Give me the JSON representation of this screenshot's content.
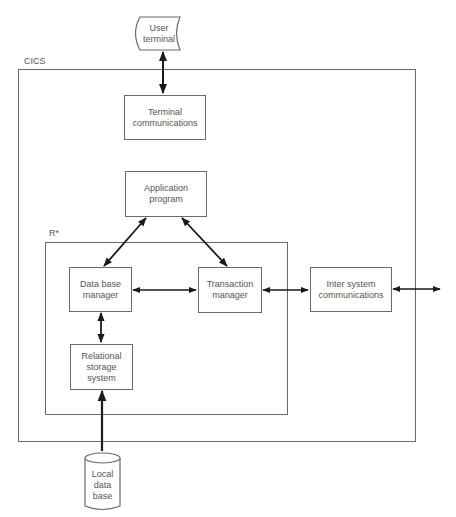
{
  "diagram": {
    "containers": {
      "cics": {
        "label": "CICS"
      },
      "rstar": {
        "label": "R*"
      }
    },
    "nodes": {
      "user_terminal": {
        "label": "User\nterminal",
        "shape": "terminal"
      },
      "terminal_communications": {
        "label": "Terminal\ncommunications"
      },
      "application_program": {
        "label": "Application\nprogram"
      },
      "data_base_manager": {
        "label": "Data base\nmanager"
      },
      "transaction_manager": {
        "label": "Transaction\nmanager"
      },
      "inter_system_communications": {
        "label": "Inter system\ncommunications"
      },
      "relational_storage_system": {
        "label": "Relational\nstorage\nsystem"
      },
      "local_data_base": {
        "label": "Local\ndata\nbase",
        "shape": "cylinder"
      }
    },
    "edges": [
      {
        "from": "user_terminal",
        "to": "terminal_communications",
        "direction": "both"
      },
      {
        "from": "application_program",
        "to": "data_base_manager",
        "direction": "both"
      },
      {
        "from": "application_program",
        "to": "transaction_manager",
        "direction": "both"
      },
      {
        "from": "data_base_manager",
        "to": "transaction_manager",
        "direction": "both"
      },
      {
        "from": "transaction_manager",
        "to": "inter_system_communications",
        "direction": "both"
      },
      {
        "from": "inter_system_communications",
        "to": "external",
        "direction": "both"
      },
      {
        "from": "data_base_manager",
        "to": "relational_storage_system",
        "direction": "both"
      },
      {
        "from": "local_data_base",
        "to": "relational_storage_system",
        "direction": "forward"
      }
    ],
    "colors": {
      "line": "#6a6a6a",
      "arrow": "#1a1a1a",
      "text": "#555555"
    }
  }
}
